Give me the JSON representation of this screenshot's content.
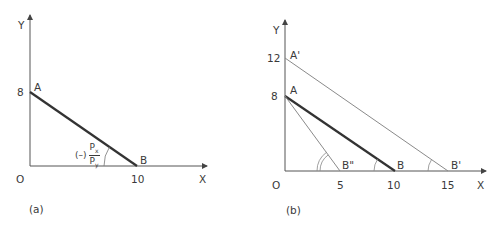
{
  "panels": [
    {
      "id": "a",
      "caption": "(a)",
      "axes": {
        "x_label": "X",
        "y_label": "Y",
        "origin_label": "O"
      },
      "y_ticks": [
        "8"
      ],
      "x_ticks": [
        "10"
      ],
      "points": {
        "A": "A",
        "B": "B"
      },
      "slope_label": {
        "sign": "(–)",
        "numerator": "P",
        "numerator_sub": "x",
        "denominator": "P",
        "denominator_sub": "y"
      },
      "lines": [
        {
          "name": "AB",
          "from": [
            0,
            8
          ],
          "to": [
            10,
            0
          ],
          "style": "thick"
        }
      ]
    },
    {
      "id": "b",
      "caption": "(b)",
      "axes": {
        "x_label": "X",
        "y_label": "Y",
        "origin_label": "O"
      },
      "y_ticks": [
        "12",
        "8"
      ],
      "x_ticks": [
        "5",
        "10",
        "15"
      ],
      "points": {
        "A_prime": "A'",
        "A": "A",
        "B_double_prime": "B\"",
        "B": "B",
        "B_prime": "B'"
      },
      "lines": [
        {
          "name": "A'B'",
          "from": [
            0,
            12
          ],
          "to": [
            15,
            0
          ],
          "style": "thin"
        },
        {
          "name": "AB",
          "from": [
            0,
            8
          ],
          "to": [
            10,
            0
          ],
          "style": "thick"
        },
        {
          "name": "AB\"",
          "from": [
            0,
            8
          ],
          "to": [
            5,
            0
          ],
          "style": "thin"
        }
      ]
    }
  ],
  "colors": {
    "thick_line": "#333333",
    "thin_line": "#8a8a8a",
    "axis": "#555555",
    "text": "#3a3a3a"
  }
}
